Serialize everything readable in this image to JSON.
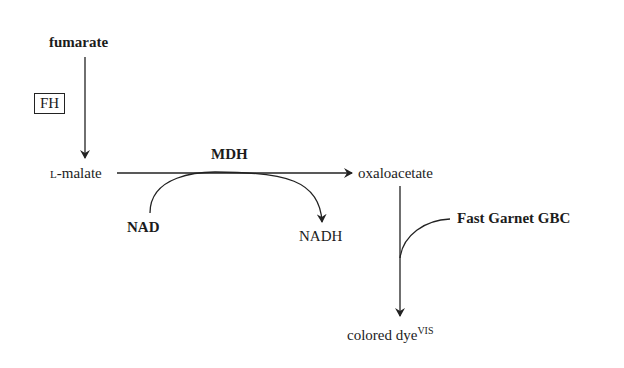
{
  "diagram": {
    "nodes": {
      "fumarate": "fumarate",
      "malate_prefix": "L",
      "malate": "-malate",
      "oxaloacetate": "oxaloacetate",
      "colored_dye": "colored dye",
      "colored_dye_sup": "VIS"
    },
    "enzymes": {
      "fh": "FH",
      "mdh": "MDH"
    },
    "cofactors": {
      "nad": "NAD",
      "nadh": "NADH",
      "reagent": "Fast Garnet GBC"
    },
    "colors": {
      "line": "#222222",
      "text": "#1c1c1c",
      "background": "#ffffff"
    }
  }
}
